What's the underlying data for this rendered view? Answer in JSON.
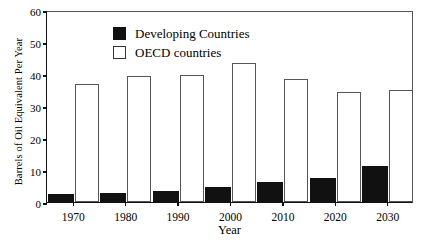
{
  "chart_data": {
    "type": "bar",
    "title": "",
    "xlabel": "Year",
    "ylabel": "Barrels of Oil Equivalent Per Year",
    "categories": [
      "1970",
      "1980",
      "1990",
      "2000",
      "2010",
      "2020",
      "2030"
    ],
    "series": [
      {
        "name": "Developing Countries",
        "style": "filled-black",
        "color": "#111111",
        "values": [
          2.5,
          2.8,
          3.5,
          4.7,
          6.3,
          7.5,
          11.2
        ]
      },
      {
        "name": "OECD countries",
        "style": "hollow-white",
        "color": "#ffffff",
        "values": [
          36.9,
          39.4,
          39.8,
          43.4,
          38.5,
          34.5,
          35.0
        ]
      }
    ],
    "ylim": [
      0,
      60
    ],
    "yticks": [
      0,
      10,
      20,
      30,
      40,
      50,
      60
    ],
    "ytick_labels": [
      "0",
      "10",
      "20",
      "30",
      "40",
      "50",
      "60"
    ],
    "grid": false,
    "legend_position": "top-left",
    "legend": [
      "Developing Countries",
      "OECD countries"
    ]
  },
  "axis": {
    "y_title": "Barrels of Oil Equivalent Per Year",
    "x_title": "Year"
  }
}
